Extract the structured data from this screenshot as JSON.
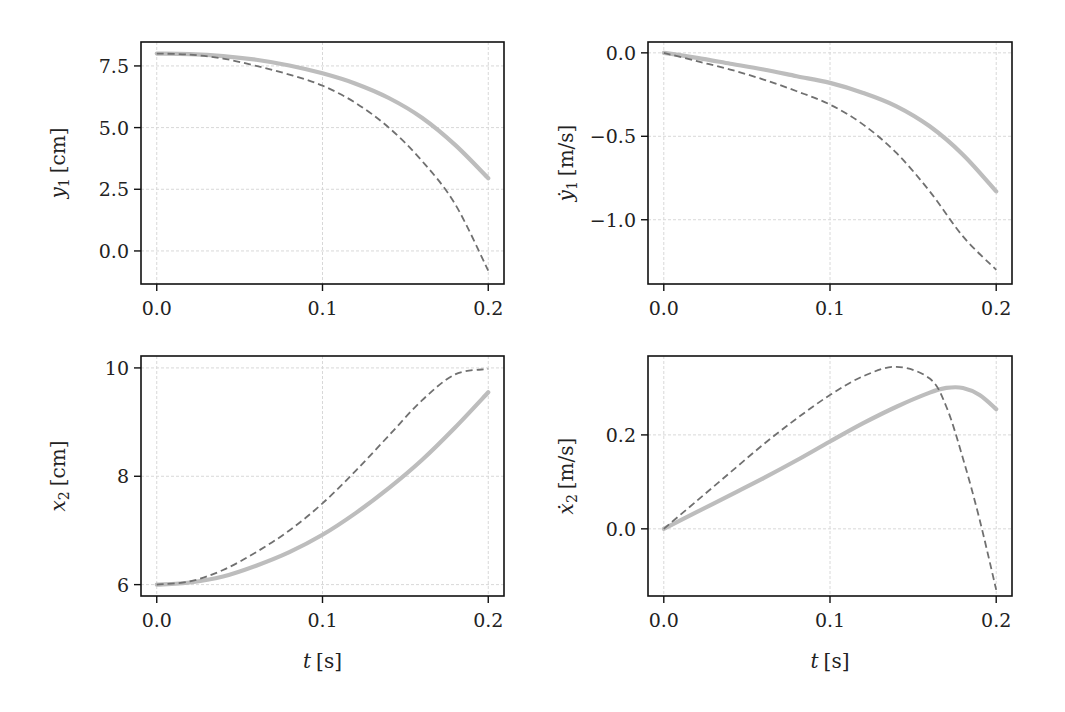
{
  "figure": {
    "style": {
      "background": "#ffffff",
      "spine_color": "#111111",
      "grid_color": "#d8d8d8",
      "solid_color": "#bdbdbd",
      "dashed_color": "#707070"
    }
  },
  "chart_data": [
    {
      "type": "line",
      "id": "y1",
      "ylabel_var": "y",
      "ylabel_sub": "1",
      "ylabel_dot": false,
      "ylabel_unit": "[cm]",
      "xlabel": "",
      "xlim": [
        -0.0095,
        0.2095
      ],
      "ylim": [
        -1.34,
        8.47
      ],
      "xticks": [
        0.0,
        0.1,
        0.2
      ],
      "xtick_labels": [
        "0.0",
        "0.1",
        "0.2"
      ],
      "yticks": [
        7.5,
        5.0,
        2.5,
        0.0
      ],
      "ytick_labels": [
        "7.5",
        "5.0",
        "2.5",
        "0.0"
      ],
      "grid": true,
      "box": {
        "left": 141,
        "top": 42,
        "right": 504,
        "bottom": 284
      },
      "x": [
        0.0,
        0.02,
        0.04,
        0.06,
        0.08,
        0.1,
        0.12,
        0.14,
        0.16,
        0.18,
        0.2
      ],
      "series": [
        {
          "name": "solid",
          "style": "solid",
          "values": [
            8.0,
            7.98,
            7.9,
            7.75,
            7.52,
            7.2,
            6.78,
            6.2,
            5.4,
            4.3,
            2.95
          ]
        },
        {
          "name": "dashed",
          "style": "dashed",
          "values": [
            8.0,
            7.96,
            7.8,
            7.5,
            7.15,
            6.7,
            6.0,
            5.0,
            3.65,
            1.9,
            -0.8
          ]
        }
      ]
    },
    {
      "type": "line",
      "id": "y1dot",
      "ylabel_var": "y",
      "ylabel_sub": "1",
      "ylabel_dot": true,
      "ylabel_unit": "[m/s]",
      "xlabel": "",
      "xlim": [
        -0.0095,
        0.2095
      ],
      "ylim": [
        -1.385,
        0.065
      ],
      "xticks": [
        0.0,
        0.1,
        0.2
      ],
      "xtick_labels": [
        "0.0",
        "0.1",
        "0.2"
      ],
      "yticks": [
        0.0,
        -0.5,
        -1.0
      ],
      "ytick_labels": [
        "0.0",
        "−0.5",
        "−1.0"
      ],
      "grid": true,
      "box": {
        "left": 648,
        "top": 42,
        "right": 1012,
        "bottom": 284
      },
      "x": [
        0.0,
        0.02,
        0.04,
        0.06,
        0.08,
        0.1,
        0.12,
        0.14,
        0.16,
        0.18,
        0.2
      ],
      "series": [
        {
          "name": "solid",
          "style": "solid",
          "values": [
            0.0,
            -0.03,
            -0.065,
            -0.1,
            -0.14,
            -0.18,
            -0.24,
            -0.32,
            -0.44,
            -0.61,
            -0.83
          ]
        },
        {
          "name": "dashed",
          "style": "dashed",
          "values": [
            0.0,
            -0.05,
            -0.1,
            -0.16,
            -0.23,
            -0.31,
            -0.43,
            -0.6,
            -0.83,
            -1.1,
            -1.3
          ]
        }
      ]
    },
    {
      "type": "line",
      "id": "x2",
      "ylabel_var": "x",
      "ylabel_sub": "2",
      "ylabel_dot": false,
      "ylabel_unit": "[cm]",
      "xlabel": "t [s]",
      "xlim": [
        -0.0095,
        0.2095
      ],
      "ylim": [
        5.79,
        10.22
      ],
      "xticks": [
        0.0,
        0.1,
        0.2
      ],
      "xtick_labels": [
        "0.0",
        "0.1",
        "0.2"
      ],
      "yticks": [
        10,
        8,
        6
      ],
      "ytick_labels": [
        "10",
        "8",
        "6"
      ],
      "grid": true,
      "box": {
        "left": 141,
        "top": 356,
        "right": 504,
        "bottom": 596
      },
      "x": [
        0.0,
        0.02,
        0.04,
        0.06,
        0.08,
        0.1,
        0.12,
        0.14,
        0.16,
        0.18,
        0.2
      ],
      "series": [
        {
          "name": "solid",
          "style": "solid",
          "values": [
            6.0,
            6.04,
            6.15,
            6.35,
            6.6,
            6.92,
            7.32,
            7.78,
            8.3,
            8.9,
            9.55
          ]
        },
        {
          "name": "dashed",
          "style": "dashed",
          "values": [
            6.0,
            6.06,
            6.27,
            6.6,
            7.0,
            7.5,
            8.1,
            8.75,
            9.4,
            9.88,
            9.98
          ]
        }
      ]
    },
    {
      "type": "line",
      "id": "x2dot",
      "ylabel_var": "x",
      "ylabel_sub": "2",
      "ylabel_dot": true,
      "ylabel_unit": "[m/s]",
      "xlabel": "t [s]",
      "xlim": [
        -0.0095,
        0.2095
      ],
      "ylim": [
        -0.143,
        0.368
      ],
      "xticks": [
        0.0,
        0.1,
        0.2
      ],
      "xtick_labels": [
        "0.0",
        "0.1",
        "0.2"
      ],
      "yticks": [
        0.2,
        0.0
      ],
      "ytick_labels": [
        "0.2",
        "0.0"
      ],
      "grid": true,
      "box": {
        "left": 648,
        "top": 356,
        "right": 1012,
        "bottom": 596
      },
      "x": [
        0.0,
        0.02,
        0.04,
        0.06,
        0.08,
        0.1,
        0.12,
        0.14,
        0.16,
        0.17,
        0.18,
        0.19,
        0.2
      ],
      "series": [
        {
          "name": "solid",
          "style": "solid",
          "values": [
            0.0,
            0.036,
            0.072,
            0.108,
            0.146,
            0.186,
            0.225,
            0.26,
            0.29,
            0.3,
            0.3,
            0.285,
            0.255
          ]
        },
        {
          "name": "dashed",
          "style": "dashed",
          "values": [
            0.0,
            0.06,
            0.12,
            0.18,
            0.235,
            0.285,
            0.325,
            0.345,
            0.32,
            0.26,
            0.15,
            0.02,
            -0.13
          ]
        }
      ]
    }
  ]
}
